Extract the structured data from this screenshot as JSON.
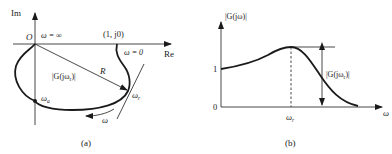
{
  "panel_a": {
    "caption": "(a)",
    "axis_y_label": "Im",
    "axis_x_label": "Re",
    "origin_label": "O",
    "omega_inf_label": "ω = ∞",
    "point_label": "(1, j0)",
    "omega_zero_label": "ω = 0",
    "radius_label": "R",
    "magnitude_label": "|G(jω",
    "magnitude_sub": "r",
    "magnitude_close": ")|",
    "omega_a_label": "ω",
    "omega_a_sub": "a",
    "omega_r_label": "ω",
    "omega_r_sub": "r",
    "direction_label": "ω"
  },
  "panel_b": {
    "caption": "(b)",
    "axis_y_label": "|G(jω)|",
    "axis_x_label": "ω",
    "tick_one": "1",
    "tick_zero": "0",
    "omega_r_label": "ω",
    "omega_r_sub": "r",
    "peak_label": "|G(jω",
    "peak_sub": "r",
    "peak_close": ")|"
  },
  "colors": {
    "stroke": "#1a1a1a",
    "background": "#ffffff"
  }
}
